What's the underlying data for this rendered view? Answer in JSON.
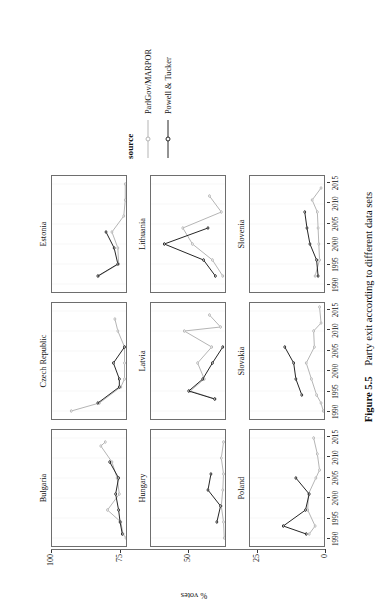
{
  "figure": {
    "caption_number": "Figure 5.5",
    "caption_text": "Party exit according to different data sets"
  },
  "legend": {
    "title": "source",
    "entries": [
      {
        "label": "ParlGov/MARPOR",
        "color": "#b5b5b5"
      },
      {
        "label": "Powell & Tucker",
        "color": "#262626"
      }
    ]
  },
  "axes": {
    "ylabel": "% votes",
    "yticks": [
      "100",
      "75",
      "50",
      "25",
      "0"
    ],
    "ytick_values": [
      100,
      75,
      50,
      25,
      0
    ],
    "ylim": [
      0,
      100
    ],
    "xticks": [
      "1990",
      "1995",
      "2000",
      "2005",
      "2010",
      "2015"
    ],
    "xtick_values": [
      1990,
      1995,
      2000,
      2005,
      2010,
      2015
    ],
    "xlim": [
      1988,
      2017
    ]
  },
  "chart_data": {
    "type": "line",
    "title": "Party exit according to different data sets",
    "xlabel": "",
    "ylabel": "% votes",
    "xlim": [
      1988,
      2017
    ],
    "ylim": [
      0,
      100
    ],
    "grid": true,
    "legend_position": "right",
    "legend_title": "source",
    "facet_layout": [
      3,
      3
    ],
    "panels": [
      {
        "name": "Bulgaria",
        "series": [
          {
            "name": "ParlGov/MARPOR",
            "color": "#b5b5b5",
            "x": [
              1990,
              1991,
              1994,
              1997,
              2001,
              2005,
              2009,
              2013,
              2014
            ],
            "y": [
              0,
              4,
              7,
              25,
              9,
              12,
              19,
              34,
              28
            ]
          },
          {
            "name": "Powell & Tucker",
            "color": "#262626",
            "x": [
              1991,
              1994,
              1997,
              2001,
              2005,
              2009
            ],
            "y": [
              5,
              8,
              10,
              14,
              10,
              22
            ]
          }
        ]
      },
      {
        "name": "Czech Republic",
        "series": [
          {
            "name": "ParlGov/MARPOR",
            "color": "#b5b5b5",
            "x": [
              1990,
              1992,
              1996,
              1998,
              2002,
              2006,
              2010,
              2013
            ],
            "y": [
              74,
              36,
              7,
              2,
              2,
              2,
              11,
              15
            ]
          },
          {
            "name": "Powell & Tucker",
            "color": "#262626",
            "x": [
              1992,
              1996,
              1998,
              2002,
              2006
            ],
            "y": [
              38,
              9,
              9,
              17,
              2
            ]
          }
        ]
      },
      {
        "name": "Estonia",
        "series": [
          {
            "name": "ParlGov/MARPOR",
            "color": "#b5b5b5",
            "x": [
              1992,
              1995,
              1999,
              2003,
              2007,
              2011,
              2015
            ],
            "y": [
              37,
              10,
              11,
              19,
              3,
              1,
              1
            ]
          },
          {
            "name": "Powell & Tucker",
            "color": "#262626",
            "x": [
              1992,
              1995,
              1999,
              2003
            ],
            "y": [
              38,
              11,
              16,
              27
            ]
          }
        ]
      },
      {
        "name": "Hungary",
        "series": [
          {
            "name": "ParlGov/MARPOR",
            "color": "#b5b5b5",
            "x": [
              1990,
              1994,
              1998,
              2002,
              2006,
              2010,
              2014
            ],
            "y": [
              1,
              2,
              5,
              3,
              2,
              5,
              2
            ]
          },
          {
            "name": "Powell & Tucker",
            "color": "#262626",
            "x": [
              1994,
              1998,
              2002,
              2006
            ],
            "y": [
              11,
              6,
              23,
              19
            ]
          }
        ]
      },
      {
        "name": "Latvia",
        "series": [
          {
            "name": "ParlGov/MARPOR",
            "color": "#b5b5b5",
            "x": [
              1993,
              1995,
              1998,
              2002,
              2006,
              2010,
              2011,
              2014
            ],
            "y": [
              13,
              47,
              28,
              37,
              18,
              55,
              6,
              21
            ]
          },
          {
            "name": "Powell & Tucker",
            "color": "#262626",
            "x": [
              1993,
              1995,
              1998,
              2002,
              2006
            ],
            "y": [
              14,
              49,
              30,
              17,
              3
            ]
          }
        ]
      },
      {
        "name": "Lithuania",
        "series": [
          {
            "name": "ParlGov/MARPOR",
            "color": "#b5b5b5",
            "x": [
              1992,
              1996,
              2000,
              2004,
              2008,
              2012
            ],
            "y": [
              3,
              17,
              44,
              57,
              5,
              21
            ]
          },
          {
            "name": "Powell & Tucker",
            "color": "#262626",
            "x": [
              1992,
              1996,
              2000,
              2004
            ],
            "y": [
              13,
              29,
              82,
              23
            ]
          }
        ]
      },
      {
        "name": "Poland",
        "series": [
          {
            "name": "ParlGov/MARPOR",
            "color": "#b5b5b5",
            "x": [
              1991,
              1993,
              1997,
              2001,
              2005,
              2007,
              2011,
              2015
            ],
            "y": [
              20,
              12,
              22,
              21,
              11,
              6,
              9,
              14
            ]
          },
          {
            "name": "Powell & Tucker",
            "color": "#262626",
            "x": [
              1991,
              1993,
              1997,
              2001,
              2005
            ],
            "y": [
              24,
              55,
              25,
              20,
              38
            ]
          }
        ]
      },
      {
        "name": "Slovakia",
        "series": [
          {
            "name": "ParlGov/MARPOR",
            "color": "#b5b5b5",
            "x": [
              1990,
              1992,
              1994,
              1998,
              2002,
              2006,
              2010,
              2012,
              2016
            ],
            "y": [
              1,
              4,
              10,
              17,
              24,
              13,
              14,
              4,
              6
            ]
          },
          {
            "name": "Powell & Tucker",
            "color": "#262626",
            "x": [
              1994,
              1998,
              2002,
              2006
            ],
            "y": [
              30,
              38,
              41,
              53
            ]
          }
        ]
      },
      {
        "name": "Slovenia",
        "series": [
          {
            "name": "ParlGov/MARPOR",
            "color": "#b5b5b5",
            "x": [
              1992,
              1996,
              2000,
              2004,
              2008,
              2011,
              2014
            ],
            "y": [
              12,
              6,
              7,
              8,
              9,
              16,
              4
            ]
          },
          {
            "name": "Powell & Tucker",
            "color": "#262626",
            "x": [
              1992,
              1996,
              2000,
              2004,
              2008
            ],
            "y": [
              8,
              10,
              19,
              23,
              26
            ]
          }
        ]
      }
    ]
  }
}
